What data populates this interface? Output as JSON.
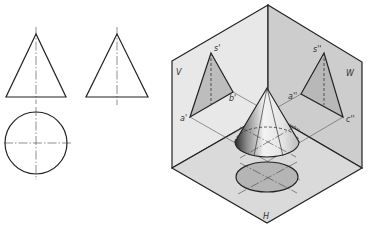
{
  "figure": {
    "orthographic_views": {
      "front_view": {
        "shape": "triangle",
        "apex": [
          36,
          34
        ],
        "base_left": [
          6,
          97
        ],
        "base_right": [
          66,
          97
        ]
      },
      "side_view": {
        "shape": "triangle",
        "apex": [
          117,
          34
        ],
        "base_left": [
          86,
          97
        ],
        "base_right": [
          148,
          97
        ]
      },
      "top_view": {
        "shape": "circle",
        "center": [
          36,
          143
        ],
        "radius": 31
      }
    },
    "projection_box": {
      "planes": {
        "V": {
          "label": "V",
          "color": "#e8e8e8"
        },
        "W": {
          "label": "W",
          "color": "#cdcdcd"
        },
        "H": {
          "label": "H",
          "color": "#dadada"
        }
      },
      "points": {
        "s_prime": "s'",
        "a_prime": "a'",
        "b_prime": "b'",
        "s_double_prime": "s''",
        "a_double_prime": "a''",
        "c_double_prime": "c''"
      }
    },
    "colors": {
      "line": "#222222",
      "projection_fill": "#bdbdbd",
      "background": "#ffffff"
    }
  }
}
